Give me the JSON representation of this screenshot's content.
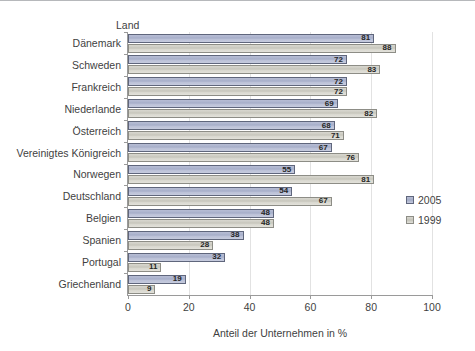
{
  "chart_data": {
    "type": "bar",
    "orientation": "horizontal",
    "title": "",
    "xlabel": "Anteil der Unternehmen in %",
    "ylabel": "Land",
    "xlim": [
      0,
      100
    ],
    "xticks": [
      0,
      20,
      40,
      60,
      80,
      100
    ],
    "grid": true,
    "legend_position": "right",
    "categories": [
      "Dänemark",
      "Schweden",
      "Frankreich",
      "Niederlande",
      "Österreich",
      "Vereinigtes Königreich",
      "Norwegen",
      "Deutschland",
      "Belgien",
      "Spanien",
      "Portugal",
      "Griechenland"
    ],
    "series": [
      {
        "name": "2005",
        "color": "#aeb5cf",
        "values": [
          81,
          72,
          72,
          69,
          68,
          67,
          55,
          54,
          48,
          38,
          32,
          19
        ]
      },
      {
        "name": "1999",
        "color": "#cfcec5",
        "values": [
          88,
          83,
          72,
          82,
          71,
          76,
          81,
          67,
          48,
          28,
          11,
          9
        ]
      }
    ]
  },
  "legend": {
    "items": [
      {
        "label": "2005"
      },
      {
        "label": "1999"
      }
    ]
  },
  "axes": {
    "y_title": "Land",
    "x_title": "Anteil der Unternehmen in %",
    "x_tick_labels": [
      "0",
      "20",
      "40",
      "60",
      "80",
      "100"
    ]
  }
}
